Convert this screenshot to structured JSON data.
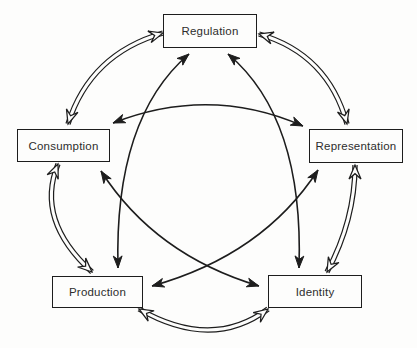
{
  "diagram": {
    "name": "circuit-of-culture",
    "background": "#fdfdfc",
    "line_color": "#1d1d1d",
    "box_fill": "#fdfdfc",
    "nodes": [
      {
        "id": "regulation",
        "label": "Regulation",
        "x": 163,
        "y": 14,
        "w": 94,
        "h": 34
      },
      {
        "id": "consumption",
        "label": "Consumption",
        "x": 17,
        "y": 129,
        "w": 93,
        "h": 33
      },
      {
        "id": "representation",
        "label": "Representation",
        "x": 309,
        "y": 129,
        "w": 94,
        "h": 34
      },
      {
        "id": "production",
        "label": "Production",
        "x": 52,
        "y": 276,
        "w": 91,
        "h": 32
      },
      {
        "id": "identity",
        "label": "Identity",
        "x": 268,
        "y": 275,
        "w": 94,
        "h": 33
      }
    ],
    "edges": [
      {
        "from": "regulation",
        "to": "consumption",
        "style": "double",
        "p0": [
          163,
          33
        ],
        "c": [
          90,
          54
        ],
        "p1": [
          68,
          124
        ]
      },
      {
        "from": "regulation",
        "to": "representation",
        "style": "double",
        "p0": [
          259,
          34
        ],
        "c": [
          328,
          54
        ],
        "p1": [
          347,
          124
        ]
      },
      {
        "from": "consumption",
        "to": "production",
        "style": "double",
        "p0": [
          58,
          164
        ],
        "c": [
          35,
          220
        ],
        "p1": [
          92,
          272
        ]
      },
      {
        "from": "representation",
        "to": "identity",
        "style": "double",
        "p0": [
          355,
          165
        ],
        "c": [
          355,
          220
        ],
        "p1": [
          327,
          272
        ]
      },
      {
        "from": "production",
        "to": "identity",
        "style": "double",
        "p0": [
          139,
          309
        ],
        "c": [
          212,
          351
        ],
        "p1": [
          268,
          309
        ]
      },
      {
        "from": "regulation",
        "to": "production",
        "style": "single",
        "p0": [
          189,
          54
        ],
        "c": [
          114,
          118
        ],
        "p1": [
          118,
          268
        ]
      },
      {
        "from": "regulation",
        "to": "identity",
        "style": "single",
        "p0": [
          228,
          54
        ],
        "c": [
          304,
          118
        ],
        "p1": [
          299,
          268
        ]
      },
      {
        "from": "consumption",
        "to": "representation",
        "style": "single",
        "p0": [
          113,
          123
        ],
        "c": [
          210,
          85
        ],
        "p1": [
          303,
          126
        ]
      },
      {
        "from": "consumption",
        "to": "identity",
        "style": "single",
        "p0": [
          101,
          171
        ],
        "c": [
          155,
          255
        ],
        "p1": [
          259,
          286
        ]
      },
      {
        "from": "production",
        "to": "representation",
        "style": "single",
        "p0": [
          152,
          286
        ],
        "c": [
          263,
          255
        ],
        "p1": [
          318,
          170
        ]
      }
    ]
  }
}
